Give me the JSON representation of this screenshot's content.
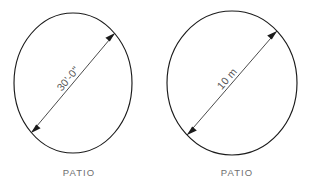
{
  "page": {
    "background_color": "#ffffff",
    "line_color": "#1b1b1b",
    "label_color": "#6f6f6f",
    "dimension_text_color": "#555555",
    "width": 320,
    "height": 189
  },
  "figures": [
    {
      "id": "patio-imperial",
      "shape": "circle",
      "caption": "PATIO",
      "dimension_label": "30'-0\"",
      "dimension_kind": "diameter",
      "dimension_value": 30,
      "dimension_unit": "feet-inches",
      "arrowheads": "both-ends",
      "geometry": {
        "cx": 73,
        "cy": 83,
        "rx": 59,
        "ry": 70,
        "dim_x1": 31,
        "dim_y1": 133,
        "dim_x2": 115,
        "dim_y2": 33,
        "text_x": 73,
        "text_y": 83,
        "text_rotation": -50,
        "caption_x": 79,
        "caption_y": 176
      }
    },
    {
      "id": "patio-metric",
      "shape": "circle",
      "caption": "PATIO",
      "dimension_label": "10 m",
      "dimension_kind": "diameter",
      "dimension_value": 10,
      "dimension_unit": "meters",
      "arrowheads": "both-ends",
      "geometry": {
        "cx": 232,
        "cy": 83,
        "rx": 65,
        "ry": 72,
        "dim_x1": 187,
        "dim_y1": 135,
        "dim_x2": 277,
        "dim_y2": 31,
        "text_x": 232,
        "text_y": 83,
        "text_rotation": -49,
        "caption_x": 237,
        "caption_y": 176
      }
    }
  ]
}
